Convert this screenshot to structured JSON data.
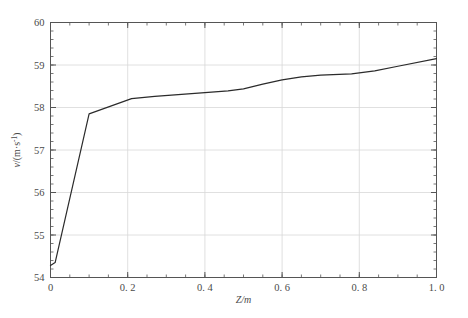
{
  "chart_data": {
    "type": "line",
    "title": "",
    "xlabel": "Z/m",
    "ylabel": "v/(m·s⁻¹)",
    "ylabel_parts": {
      "symbol": "v",
      "slash": "/(m·s",
      "exponent": "-1",
      "close": ")"
    },
    "xlim": [
      0,
      1.0
    ],
    "ylim": [
      54,
      60
    ],
    "grid": true,
    "legend": "none",
    "x_ticks": [
      0,
      0.2,
      0.4,
      0.6,
      0.8,
      1.0
    ],
    "x_tick_labels": [
      "0",
      "0. 2",
      "0. 4",
      "0. 6",
      "0. 8",
      "1. 0"
    ],
    "y_ticks": [
      54,
      55,
      56,
      57,
      58,
      59,
      60
    ],
    "y_tick_labels": [
      "54",
      "55",
      "56",
      "57",
      "58",
      "59",
      "60"
    ],
    "x_minor_interval": 0.05,
    "y_minor_interval": 0.2,
    "line_color": "#2b2b2b",
    "line_width": 1.2,
    "grid_color": "#d8d8d8",
    "axis_color": "#555555",
    "series": [
      {
        "name": "velocity",
        "x": [
          0.0,
          0.012,
          0.1,
          0.21,
          0.27,
          0.4,
          0.46,
          0.5,
          0.55,
          0.6,
          0.65,
          0.7,
          0.78,
          0.84,
          0.9,
          1.0
        ],
        "y": [
          54.28,
          54.35,
          57.85,
          58.21,
          58.26,
          58.35,
          58.39,
          58.44,
          58.55,
          58.65,
          58.72,
          58.76,
          58.79,
          58.86,
          58.97,
          59.15
        ]
      }
    ]
  }
}
